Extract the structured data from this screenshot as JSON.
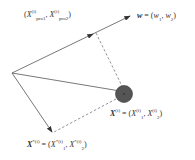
{
  "diagram": {
    "type": "vector projection",
    "vector_w": {
      "label": "w",
      "components": [
        "w",
        "1",
        "w",
        "2"
      ]
    },
    "projection_point": {
      "label_prefix": "X",
      "sup": "(i)",
      "sub1": "pro1",
      "sub2": "pro2"
    },
    "point_x": {
      "label": "X",
      "sup": "(i)",
      "comp_sup": "(i)",
      "sub1": "1",
      "sub2": "2"
    },
    "point_xstar": {
      "label": "X",
      "sup": "*(i)",
      "comp_sup": "*(i)",
      "sub1": "1",
      "sub2": "2"
    },
    "colors": {
      "lines": "#555555",
      "point_fill": "#555555",
      "dashed": "#666666"
    }
  }
}
